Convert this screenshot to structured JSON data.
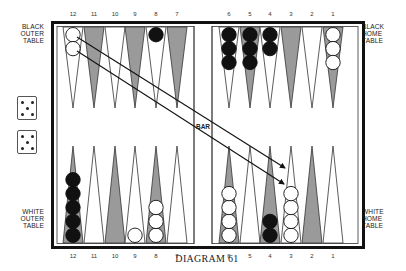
{
  "diagram": {
    "caption": "DIAGRAM 61",
    "bar_label": "BAR",
    "labels": {
      "black_outer": [
        "BLACK",
        "OUTER",
        "TABLE"
      ],
      "black_home": [
        "BLACK",
        "HOME",
        "TABLE"
      ],
      "white_outer": [
        "WHITE",
        "OUTER",
        "TABLE"
      ],
      "white_home": [
        "WHITE",
        "HOME",
        "TABLE"
      ]
    },
    "top_numbers": [
      "12",
      "11",
      "10",
      "9",
      "8",
      "7",
      "6",
      "5",
      "4",
      "3",
      "2",
      "1"
    ],
    "bottom_numbers": [
      "12",
      "11",
      "10",
      "9",
      "8",
      "7",
      "6",
      "5",
      "4",
      "3",
      "2",
      "1"
    ],
    "dice": [
      {
        "value": 5,
        "name": "die-1"
      },
      {
        "value": 5,
        "name": "die-2"
      }
    ],
    "colors": {
      "shaded_point": "#9a9a9a",
      "black_checker": "#111111",
      "white_checker": "#ffffff",
      "frame": "#111111",
      "line": "#333333"
    },
    "top_points": [
      {
        "number": "12",
        "shaded": false,
        "checkers": {
          "color": "white",
          "count": 2
        }
      },
      {
        "number": "11",
        "shaded": true,
        "checkers": null
      },
      {
        "number": "10",
        "shaded": false,
        "checkers": null
      },
      {
        "number": "9",
        "shaded": true,
        "checkers": null
      },
      {
        "number": "8",
        "shaded": false,
        "checkers": {
          "color": "black",
          "count": 1
        }
      },
      {
        "number": "7",
        "shaded": true,
        "checkers": null
      },
      {
        "number": "6",
        "shaded": false,
        "checkers": {
          "color": "black",
          "count": 3
        }
      },
      {
        "number": "5",
        "shaded": true,
        "checkers": {
          "color": "black",
          "count": 3
        }
      },
      {
        "number": "4",
        "shaded": false,
        "checkers": {
          "color": "black",
          "count": 2
        }
      },
      {
        "number": "3",
        "shaded": true,
        "checkers": null
      },
      {
        "number": "2",
        "shaded": false,
        "checkers": null
      },
      {
        "number": "1",
        "shaded": true,
        "checkers": {
          "color": "white",
          "count": 3
        }
      }
    ],
    "bottom_points": [
      {
        "number": "12",
        "shaded": true,
        "checkers": {
          "color": "black",
          "count": 5
        }
      },
      {
        "number": "11",
        "shaded": false,
        "checkers": null
      },
      {
        "number": "10",
        "shaded": true,
        "checkers": null
      },
      {
        "number": "9",
        "shaded": false,
        "checkers": {
          "color": "white",
          "count": 1
        }
      },
      {
        "number": "8",
        "shaded": true,
        "checkers": {
          "color": "white",
          "count": 3
        }
      },
      {
        "number": "7",
        "shaded": false,
        "checkers": null
      },
      {
        "number": "6",
        "shaded": true,
        "checkers": {
          "color": "white",
          "count": 4
        }
      },
      {
        "number": "5",
        "shaded": false,
        "checkers": null
      },
      {
        "number": "4",
        "shaded": true,
        "checkers": {
          "color": "black",
          "count": 2
        }
      },
      {
        "number": "3",
        "shaded": false,
        "checkers": {
          "color": "white",
          "count": 4
        }
      },
      {
        "number": "2",
        "shaded": true,
        "checkers": null
      },
      {
        "number": "1",
        "shaded": false,
        "checkers": null
      }
    ],
    "moves": [
      {
        "from": "top-12",
        "to": "bottom-3",
        "description": "white checker moves from black outer table 12-point to white home table 3-point"
      },
      {
        "from": "top-12",
        "to": "bottom-3",
        "description": "white checker moves from black outer table 12-point to white home table 3-point"
      }
    ]
  }
}
